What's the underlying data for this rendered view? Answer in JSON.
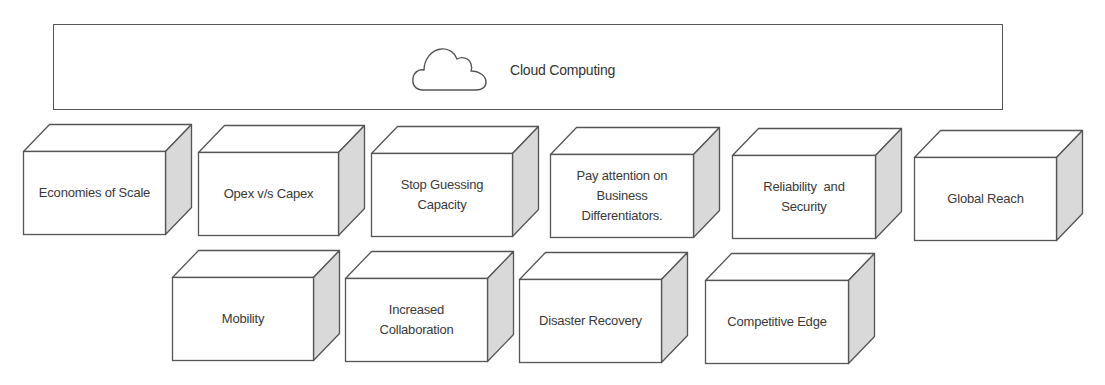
{
  "header": {
    "title": "Cloud Computing",
    "icon": "cloud-icon"
  },
  "benefits": {
    "row1": [
      {
        "label": "Economies of Scale"
      },
      {
        "label": "Opex v/s Capex"
      },
      {
        "label": "Stop Guessing Capacity"
      },
      {
        "label": "Pay attention on Business Differentiators."
      },
      {
        "label": "Reliability  and Security"
      },
      {
        "label": "Global Reach"
      }
    ],
    "row2": [
      {
        "label": "Mobility"
      },
      {
        "label": "Increased Collaboration"
      },
      {
        "label": "Disaster Recovery"
      },
      {
        "label": "Competitive Edge"
      }
    ]
  },
  "colors": {
    "outline": "#555555",
    "side_face": "#d9d9d9",
    "front_face": "#ffffff",
    "text": "#333333"
  }
}
